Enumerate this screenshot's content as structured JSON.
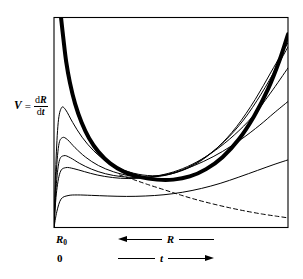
{
  "figure": {
    "background_color": "#ffffff",
    "line_color": "#000000",
    "axis": {
      "y_label_var": "V",
      "y_label_equals": "=",
      "y_label_numerator_d": "d",
      "y_label_numerator_var": "R",
      "y_label_denominator_d": "d",
      "y_label_denominator_var": "t",
      "origin_label_R": "R",
      "origin_label_R_subscript": "0",
      "origin_label_zero": "0"
    },
    "arrows": {
      "radius_label": "R",
      "radius_direction": "left",
      "time_label": "t",
      "time_direction": "right"
    }
  },
  "chart_data": {
    "type": "line",
    "title": "",
    "xlabel": "t",
    "ylabel": "V = dR/dt",
    "xlim": [
      0,
      1
    ],
    "ylim": [
      0,
      1
    ],
    "grid": false,
    "legend": "none",
    "axes_note": "Plot frame drawn on all four sides; no tick marks or numeric tick labels are shown. Horizontal axis is labelled twice: R increasing to the left, t increasing to the right.",
    "annotations": [
      {
        "text": "R",
        "subscript": "0",
        "position": "below-left-of-origin"
      },
      {
        "text": "0",
        "position": "below-left, second row"
      },
      {
        "text": "R",
        "position": "below-axis, arrow pointing left"
      },
      {
        "text": "t",
        "position": "below-axis, arrow pointing right"
      }
    ],
    "series": [
      {
        "name": "bold-envelope",
        "style": "solid",
        "line_width": 4,
        "description": "Heavy U-shaped envelope curve: enters at top of frame near left axis, falls steeply, reaches a broad minimum near mid-plot, then rises steeply to the top right corner.",
        "points": [
          [
            0.03,
            1.0
          ],
          [
            0.04,
            0.9
          ],
          [
            0.052,
            0.79
          ],
          [
            0.068,
            0.69
          ],
          [
            0.09,
            0.59
          ],
          [
            0.118,
            0.5
          ],
          [
            0.15,
            0.425
          ],
          [
            0.19,
            0.36
          ],
          [
            0.24,
            0.305
          ],
          [
            0.3,
            0.265
          ],
          [
            0.37,
            0.24
          ],
          [
            0.44,
            0.228
          ],
          [
            0.51,
            0.228
          ],
          [
            0.58,
            0.243
          ],
          [
            0.65,
            0.278
          ],
          [
            0.72,
            0.335
          ],
          [
            0.79,
            0.42
          ],
          [
            0.855,
            0.53
          ],
          [
            0.915,
            0.66
          ],
          [
            0.965,
            0.8
          ],
          [
            1.0,
            0.92
          ]
        ]
      },
      {
        "name": "trajectory-1",
        "style": "solid",
        "line_width": 1,
        "description": "Highest thin trajectory; sharp early peak then decays toward the envelope and rises with it to the top right.",
        "points": [
          [
            0.0,
            0.0
          ],
          [
            0.008,
            0.3
          ],
          [
            0.018,
            0.5
          ],
          [
            0.032,
            0.57
          ],
          [
            0.05,
            0.56
          ],
          [
            0.08,
            0.5
          ],
          [
            0.12,
            0.43
          ],
          [
            0.17,
            0.365
          ],
          [
            0.23,
            0.31
          ],
          [
            0.3,
            0.272
          ],
          [
            0.38,
            0.25
          ],
          [
            0.46,
            0.248
          ],
          [
            0.54,
            0.268
          ],
          [
            0.62,
            0.312
          ],
          [
            0.7,
            0.382
          ],
          [
            0.78,
            0.48
          ],
          [
            0.86,
            0.61
          ],
          [
            0.93,
            0.745
          ],
          [
            1.0,
            0.88
          ]
        ]
      },
      {
        "name": "trajectory-2",
        "style": "solid",
        "line_width": 1,
        "description": "Second thin trajectory with lower peak.",
        "points": [
          [
            0.0,
            0.0
          ],
          [
            0.008,
            0.23
          ],
          [
            0.02,
            0.39
          ],
          [
            0.036,
            0.428
          ],
          [
            0.058,
            0.418
          ],
          [
            0.09,
            0.38
          ],
          [
            0.135,
            0.335
          ],
          [
            0.19,
            0.295
          ],
          [
            0.255,
            0.265
          ],
          [
            0.33,
            0.245
          ],
          [
            0.41,
            0.24
          ],
          [
            0.49,
            0.252
          ],
          [
            0.57,
            0.285
          ],
          [
            0.65,
            0.338
          ],
          [
            0.73,
            0.412
          ],
          [
            0.81,
            0.512
          ],
          [
            0.885,
            0.635
          ],
          [
            0.95,
            0.76
          ],
          [
            1.0,
            0.86
          ]
        ]
      },
      {
        "name": "trajectory-3",
        "style": "solid",
        "line_width": 1,
        "description": "Third thin trajectory, flatter peak.",
        "points": [
          [
            0.0,
            0.0
          ],
          [
            0.009,
            0.19
          ],
          [
            0.022,
            0.315
          ],
          [
            0.042,
            0.342
          ],
          [
            0.07,
            0.332
          ],
          [
            0.11,
            0.305
          ],
          [
            0.16,
            0.278
          ],
          [
            0.22,
            0.256
          ],
          [
            0.29,
            0.242
          ],
          [
            0.37,
            0.238
          ],
          [
            0.45,
            0.248
          ],
          [
            0.53,
            0.272
          ],
          [
            0.61,
            0.312
          ],
          [
            0.69,
            0.368
          ],
          [
            0.77,
            0.44
          ],
          [
            0.85,
            0.53
          ],
          [
            0.925,
            0.64
          ],
          [
            1.0,
            0.76
          ]
        ]
      },
      {
        "name": "trajectory-4",
        "style": "solid",
        "line_width": 1,
        "description": "Fourth thin trajectory, low broad plateau.",
        "points": [
          [
            0.0,
            0.0
          ],
          [
            0.01,
            0.16
          ],
          [
            0.026,
            0.262
          ],
          [
            0.05,
            0.285
          ],
          [
            0.085,
            0.28
          ],
          [
            0.13,
            0.266
          ],
          [
            0.185,
            0.25
          ],
          [
            0.25,
            0.238
          ],
          [
            0.32,
            0.233
          ],
          [
            0.4,
            0.238
          ],
          [
            0.48,
            0.252
          ],
          [
            0.56,
            0.278
          ],
          [
            0.64,
            0.315
          ],
          [
            0.72,
            0.362
          ],
          [
            0.8,
            0.42
          ],
          [
            0.88,
            0.488
          ],
          [
            0.94,
            0.545
          ],
          [
            1.0,
            0.6
          ]
        ]
      },
      {
        "name": "trajectory-5",
        "style": "solid",
        "line_width": 1,
        "description": "Lowest thin trajectory; very flat, slow rise at the right.",
        "points": [
          [
            0.0,
            0.0
          ],
          [
            0.012,
            0.075
          ],
          [
            0.03,
            0.135
          ],
          [
            0.06,
            0.152
          ],
          [
            0.1,
            0.155
          ],
          [
            0.16,
            0.153
          ],
          [
            0.23,
            0.15
          ],
          [
            0.31,
            0.148
          ],
          [
            0.39,
            0.15
          ],
          [
            0.47,
            0.156
          ],
          [
            0.55,
            0.168
          ],
          [
            0.63,
            0.186
          ],
          [
            0.71,
            0.21
          ],
          [
            0.79,
            0.24
          ],
          [
            0.87,
            0.272
          ],
          [
            0.94,
            0.3
          ],
          [
            1.0,
            0.322
          ]
        ]
      },
      {
        "name": "locus-dashed",
        "style": "dashed",
        "line_width": 1,
        "description": "Dashed locus curve starting near the bold envelope minimum region and descending monotonically to the lower right corner of the frame.",
        "points": [
          [
            0.28,
            0.25
          ],
          [
            0.34,
            0.228
          ],
          [
            0.4,
            0.205
          ],
          [
            0.47,
            0.18
          ],
          [
            0.54,
            0.155
          ],
          [
            0.61,
            0.132
          ],
          [
            0.68,
            0.112
          ],
          [
            0.75,
            0.094
          ],
          [
            0.82,
            0.078
          ],
          [
            0.89,
            0.064
          ],
          [
            0.95,
            0.054
          ],
          [
            1.0,
            0.046
          ]
        ]
      }
    ]
  }
}
